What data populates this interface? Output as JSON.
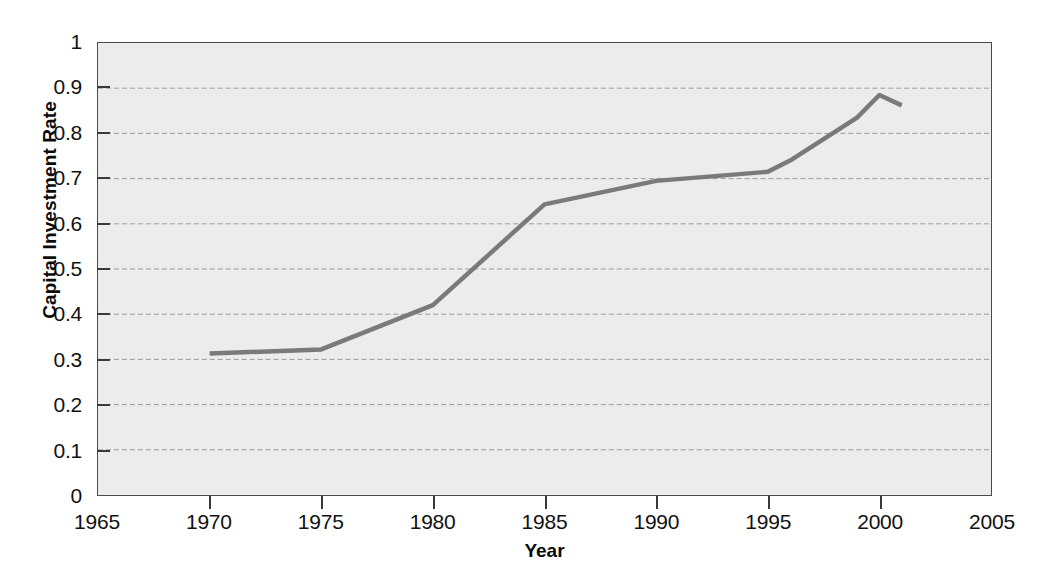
{
  "chart_data": {
    "type": "line",
    "title": "",
    "xlabel": "Year",
    "ylabel": "Capital Investment Rate",
    "xlim": [
      1965,
      2005
    ],
    "ylim": [
      0,
      1
    ],
    "grid": true,
    "grid_axis": "y",
    "legend": "none",
    "x": [
      1970,
      1975,
      1980,
      1985,
      1990,
      1995,
      1996,
      1999,
      2000,
      2001
    ],
    "values": [
      0.313,
      0.322,
      0.42,
      0.643,
      0.695,
      0.715,
      0.74,
      0.835,
      0.885,
      0.862
    ],
    "series": [
      {
        "name": "Capital Investment Rate",
        "color": "#7a7a7a",
        "points": [
          {
            "x": 1970,
            "y": 0.313
          },
          {
            "x": 1975,
            "y": 0.322
          },
          {
            "x": 1980,
            "y": 0.42
          },
          {
            "x": 1985,
            "y": 0.643
          },
          {
            "x": 1990,
            "y": 0.695
          },
          {
            "x": 1995,
            "y": 0.715
          },
          {
            "x": 1996,
            "y": 0.74
          },
          {
            "x": 1999,
            "y": 0.835
          },
          {
            "x": 2000,
            "y": 0.885
          },
          {
            "x": 2001,
            "y": 0.862
          }
        ]
      }
    ],
    "xticks": [
      1965,
      1970,
      1975,
      1980,
      1985,
      1990,
      1995,
      2000,
      2005
    ],
    "xticklabels": [
      "1965",
      "1970",
      "1975",
      "1980",
      "1985",
      "1990",
      "1995",
      "2000",
      "2005"
    ],
    "yticks": [
      0,
      0.1,
      0.2,
      0.3,
      0.4,
      0.5,
      0.6,
      0.7,
      0.8,
      0.9,
      1
    ],
    "yticklabels": [
      "0",
      "0.1",
      "0.2",
      "0.3",
      "0.4",
      "0.5",
      "0.6",
      "0.7",
      "0.8",
      "0.9",
      "1"
    ]
  },
  "colors": {
    "line": "#7a7a7a",
    "plot_background": "#ececed",
    "page_background": "#ffffff",
    "axis": "#3a3a3a",
    "gridline": "#9b9b9b",
    "text": "#111111"
  },
  "axis_titles": {
    "x": "Year",
    "y": "Capital Investment Rate"
  }
}
